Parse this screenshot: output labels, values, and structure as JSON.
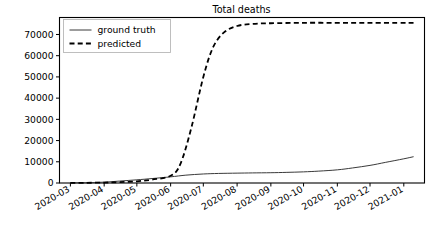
{
  "chart_data": {
    "type": "line",
    "title": "Total deaths",
    "xlabel": "",
    "ylabel": "",
    "grid": false,
    "legend_position": "upper left",
    "xlim": [
      "2020-02-20",
      "2021-01-20"
    ],
    "ylim": [
      0,
      78000
    ],
    "xticks": [
      "2020-03",
      "2020-04",
      "2020-05",
      "2020-06",
      "2020-07",
      "2020-08",
      "2020-09",
      "2020-10",
      "2020-11",
      "2020-12",
      "2021-01"
    ],
    "yticks": [
      0,
      10000,
      20000,
      30000,
      40000,
      50000,
      60000,
      70000
    ],
    "ytick_labels": [
      "0",
      "10000",
      "20000",
      "30000",
      "40000",
      "50000",
      "60000",
      "70000"
    ],
    "series": [
      {
        "name": "ground truth",
        "style": "solid",
        "color": "#3a3a3a",
        "x": [
          "2020-03-01",
          "2020-03-15",
          "2020-04-01",
          "2020-04-15",
          "2020-05-01",
          "2020-05-15",
          "2020-06-01",
          "2020-06-15",
          "2020-07-01",
          "2020-07-15",
          "2020-08-01",
          "2020-08-15",
          "2020-09-01",
          "2020-09-15",
          "2020-10-01",
          "2020-10-15",
          "2020-11-01",
          "2020-11-15",
          "2020-12-01",
          "2020-12-15",
          "2021-01-01",
          "2021-01-10"
        ],
        "values": [
          60,
          150,
          400,
          900,
          1500,
          2100,
          2900,
          3700,
          4250,
          4500,
          4650,
          4750,
          4850,
          5000,
          5250,
          5600,
          6200,
          7100,
          8300,
          9700,
          11400,
          12400
        ]
      },
      {
        "name": "predicted",
        "style": "dashed",
        "color": "#000000",
        "x": [
          "2020-03-01",
          "2020-03-15",
          "2020-04-01",
          "2020-04-15",
          "2020-05-01",
          "2020-05-15",
          "2020-06-01",
          "2020-06-10",
          "2020-06-20",
          "2020-07-01",
          "2020-07-10",
          "2020-07-20",
          "2020-08-01",
          "2020-08-15",
          "2020-09-01",
          "2020-10-01",
          "2020-11-01",
          "2020-12-01",
          "2021-01-01",
          "2021-01-10"
        ],
        "values": [
          40,
          90,
          200,
          400,
          800,
          1600,
          3400,
          9000,
          26000,
          50000,
          64000,
          71000,
          74000,
          75000,
          75300,
          75500,
          75500,
          75500,
          75500,
          75500
        ]
      }
    ],
    "annotations": []
  },
  "legend": {
    "items": [
      {
        "label": "ground truth",
        "style": "solid"
      },
      {
        "label": "predicted",
        "style": "dashed"
      }
    ]
  }
}
